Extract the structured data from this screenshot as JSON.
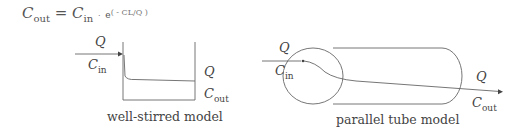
{
  "formula": {
    "lhs": "C",
    "lhs_sub": "out",
    "equals": "=",
    "rhs": "C",
    "rhs_sub": "in",
    "dot": "·",
    "exp_base": "e",
    "exponent": "( - CL/Q )"
  },
  "well_stirred": {
    "q_in": "Q",
    "c_in": "C",
    "c_in_sub": "in",
    "q_out": "Q",
    "c_out": "C",
    "c_out_sub": "out",
    "caption": "well-stirred model"
  },
  "parallel_tube": {
    "q_in": "Q",
    "c_in": "C",
    "c_in_sub": "in",
    "q_out": "Q",
    "c_out": "C",
    "c_out_sub": "out",
    "caption": "parallel tube model"
  }
}
